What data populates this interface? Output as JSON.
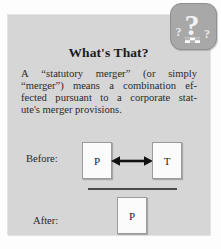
{
  "panel": {
    "title": "What's That?",
    "badge": {
      "icon": "question-mark-badge-icon"
    },
    "body_lines": [
      {
        "words": [
          "A",
          "“statutory",
          "merger”",
          "(or",
          "simply"
        ],
        "justified": true
      },
      {
        "words": [
          "“merger”)",
          "means",
          "a",
          "combination",
          "ef-"
        ],
        "justified": true
      },
      {
        "words": [
          "fected",
          "pursuant",
          "to",
          "a",
          "corporate",
          "stat-"
        ],
        "justified": true
      },
      {
        "text": "ute's merger provisions.",
        "justified": false
      }
    ],
    "body_text": "A “statutory merger” (or simply “merger”) means a combination effected pursuant to a corporate statute's merger provisions.",
    "diagram": {
      "before": {
        "label": "Before:",
        "left_entity": "P",
        "right_entity": "T",
        "relation": "double-headed-arrow"
      },
      "after": {
        "label": "After:",
        "entity": "P"
      }
    }
  },
  "colors": {
    "panel_background": "#d6d6d6",
    "page_background": "#fdfdfd",
    "badge_fill": "#a8a8a8",
    "badge_glyph": "#f2f2f2",
    "box_fill": "#fbfbfb",
    "box_border": "#9b9b9b",
    "rule": "#4a4a4a",
    "text": "#2a2a2a"
  }
}
